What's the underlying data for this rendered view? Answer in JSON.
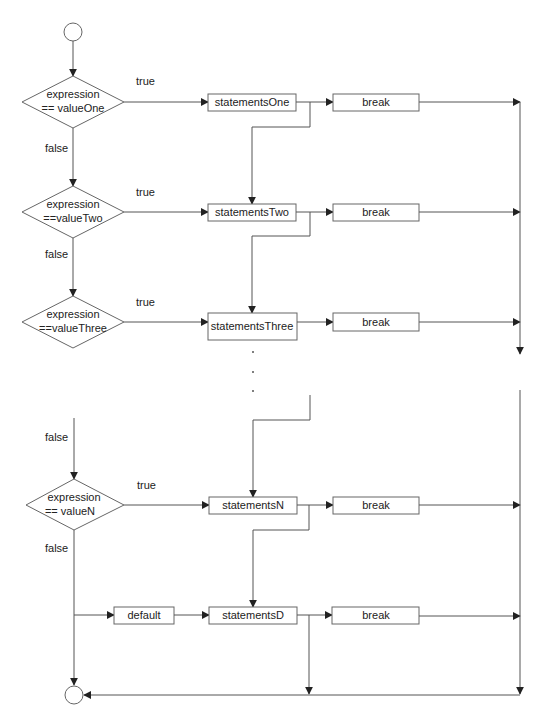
{
  "diagram": {
    "type": "flowchart",
    "line_color": "#555555",
    "arrow_color": "#222222",
    "start_node": {
      "shape": "circle"
    },
    "end_node": {
      "shape": "circle"
    },
    "cases": [
      {
        "condition_line1": "expression",
        "condition_line2": "== valueOne",
        "true_label": "true",
        "false_label": "false",
        "statements": "statementsOne",
        "break": "break"
      },
      {
        "condition_line1": "expression",
        "condition_line2": "==valueTwo",
        "true_label": "true",
        "false_label": "false",
        "statements": "statementsTwo",
        "break": "break"
      },
      {
        "condition_line1": "expression",
        "condition_line2": "==valueThree",
        "true_label": "true",
        "statements": "statementsThree",
        "break": "break"
      },
      {
        "incoming_false_label": "false",
        "condition_line1": "expression",
        "condition_line2": "== valueN",
        "true_label": "true",
        "false_label": "false",
        "statements": "statementsN",
        "break": "break"
      }
    ],
    "ellipsis": ".",
    "default_case": {
      "label": "default",
      "statements": "statementsD",
      "break": "break"
    }
  }
}
